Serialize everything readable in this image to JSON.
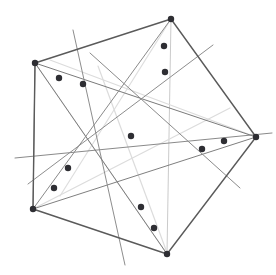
{
  "figure": {
    "title": "",
    "type": "geometric-line-drawing",
    "width": 276,
    "height": 275,
    "background_color": "#ffffff"
  },
  "chart_data": {
    "type": "scatter",
    "title": "",
    "xlabel": "",
    "ylabel": "",
    "xlim": [
      0,
      276
    ],
    "ylim": [
      0,
      275
    ],
    "grid": false,
    "legend": "none",
    "colors": {
      "outline": "#5a5a5a",
      "chord_dark": "#6e6e6e",
      "chord_mid": "#9a9a9a",
      "chord_light": "#dcdcdc",
      "marker": "#2e2e33",
      "background": "#ffffff"
    },
    "polygon": {
      "name": "pentagon-outline",
      "stroke": "#5a5a5a",
      "stroke_width": 1.4,
      "closed": true,
      "vertices": [
        {
          "label": "top-left",
          "x": 35,
          "y": 63
        },
        {
          "label": "top",
          "x": 171,
          "y": 19
        },
        {
          "label": "right",
          "x": 256,
          "y": 137
        },
        {
          "label": "bottom",
          "x": 167,
          "y": 254
        },
        {
          "label": "bottom-left",
          "x": 33,
          "y": 209
        }
      ]
    },
    "points": [
      {
        "id": "p1",
        "x": 59,
        "y": 78
      },
      {
        "id": "p2",
        "x": 83,
        "y": 84
      },
      {
        "id": "p3",
        "x": 164,
        "y": 46
      },
      {
        "id": "p4",
        "x": 165,
        "y": 72
      },
      {
        "id": "p5",
        "x": 131,
        "y": 136
      },
      {
        "id": "p6",
        "x": 224,
        "y": 141
      },
      {
        "id": "p7",
        "x": 202,
        "y": 149
      },
      {
        "id": "p8",
        "x": 68,
        "y": 168
      },
      {
        "id": "p9",
        "x": 54,
        "y": 188
      },
      {
        "id": "p10",
        "x": 141,
        "y": 207
      },
      {
        "id": "p11",
        "x": 154,
        "y": 228
      },
      {
        "id": "p12",
        "x": 35,
        "y": 63
      },
      {
        "id": "p13",
        "x": 171,
        "y": 19
      },
      {
        "id": "p14",
        "x": 256,
        "y": 137
      },
      {
        "id": "p15",
        "x": 167,
        "y": 254
      },
      {
        "id": "p16",
        "x": 33,
        "y": 209
      }
    ],
    "marker_radius": 3.2,
    "marker_color": "#2e2e33",
    "lines": [
      {
        "id": "L1",
        "x1": 35,
        "y1": 63,
        "x2": 256,
        "y2": 137,
        "stroke": "#7a7a7a",
        "width": 1.0
      },
      {
        "id": "L2",
        "x1": 15,
        "y1": 158,
        "x2": 272,
        "y2": 133,
        "stroke": "#8a8a8a",
        "width": 1.0
      },
      {
        "id": "L3",
        "x1": 33,
        "y1": 209,
        "x2": 256,
        "y2": 137,
        "stroke": "#7f7f7f",
        "width": 1.0
      },
      {
        "id": "L4",
        "x1": 73,
        "y1": 30,
        "x2": 125,
        "y2": 265,
        "stroke": "#8d8d8d",
        "width": 1.0
      },
      {
        "id": "L5",
        "x1": 213,
        "y1": 45,
        "x2": 28,
        "y2": 184,
        "stroke": "#8d8d8d",
        "width": 1.0
      },
      {
        "id": "L6",
        "x1": 171,
        "y1": 19,
        "x2": 167,
        "y2": 254,
        "stroke": "#c4c4c4",
        "width": 0.9
      },
      {
        "id": "L7",
        "x1": 35,
        "y1": 63,
        "x2": 167,
        "y2": 254,
        "stroke": "#7d7d7d",
        "width": 1.0
      },
      {
        "id": "L8",
        "x1": 171,
        "y1": 19,
        "x2": 33,
        "y2": 209,
        "stroke": "#8a8a8a",
        "width": 1.0
      },
      {
        "id": "L9",
        "x1": 90,
        "y1": 53,
        "x2": 240,
        "y2": 188,
        "stroke": "#8a8a8a",
        "width": 1.0
      },
      {
        "id": "L10",
        "x1": 35,
        "y1": 63,
        "x2": 33,
        "y2": 209,
        "stroke": "#8f8f8f",
        "width": 1.0
      },
      {
        "id": "L11",
        "x1": 33,
        "y1": 209,
        "x2": 230,
        "y2": 108,
        "stroke": "#dcdcdc",
        "width": 1.2
      },
      {
        "id": "L12",
        "x1": 35,
        "y1": 63,
        "x2": 167,
        "y2": 254,
        "stroke": "#dedede",
        "width": 1.2
      },
      {
        "id": "L13",
        "x1": 50,
        "y1": 60,
        "x2": 256,
        "y2": 137,
        "stroke": "#dcdcdc",
        "width": 1.2
      },
      {
        "id": "L14",
        "x1": 171,
        "y1": 19,
        "x2": 60,
        "y2": 196,
        "stroke": "#dedede",
        "width": 1.2
      },
      {
        "id": "L15",
        "x1": 98,
        "y1": 66,
        "x2": 166,
        "y2": 250,
        "stroke": "#dcdcdc",
        "width": 1.2
      }
    ]
  }
}
